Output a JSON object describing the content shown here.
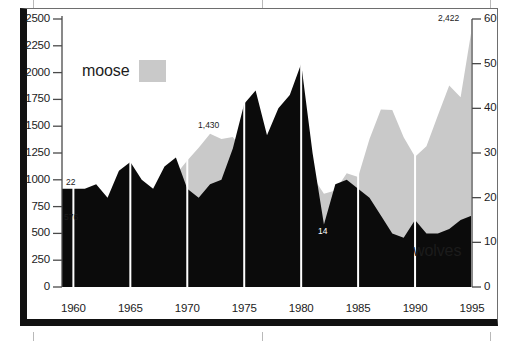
{
  "chart_data": {
    "type": "area",
    "title": "",
    "xlabel": "",
    "ylabel": "",
    "grid": true,
    "legend_position": "inside",
    "x": [
      1959,
      1960,
      1961,
      1962,
      1963,
      1964,
      1965,
      1966,
      1967,
      1968,
      1969,
      1970,
      1971,
      1972,
      1973,
      1974,
      1975,
      1976,
      1977,
      1978,
      1979,
      1980,
      1981,
      1982,
      1983,
      1984,
      1985,
      1986,
      1987,
      1988,
      1989,
      1990,
      1991,
      1992,
      1993,
      1994,
      1995
    ],
    "xtick_labels": [
      "1960",
      "1965",
      "1970",
      "1975",
      "1980",
      "1985",
      "1990",
      "1995"
    ],
    "xticks": [
      1960,
      1965,
      1970,
      1975,
      1980,
      1985,
      1990,
      1995
    ],
    "xlim": [
      1959,
      1995
    ],
    "series": [
      {
        "name": "moose",
        "axis": "left",
        "color": "#c9c9c9",
        "ylabel": "moose",
        "ylim": [
          0,
          2500
        ],
        "ytick_labels": [
          "0",
          "250",
          "500",
          "750",
          "1000",
          "1250",
          "1500",
          "1750",
          "2000",
          "2250",
          "2500"
        ],
        "yticks": [
          0,
          250,
          500,
          750,
          1000,
          1250,
          1500,
          1750,
          2000,
          2250,
          2500
        ],
        "values": [
          576,
          600,
          617,
          640,
          670,
          700,
          740,
          780,
          860,
          960,
          1050,
          1180,
          1300,
          1430,
          1380,
          1400,
          1260,
          1180,
          1070,
          1080,
          960,
          1000,
          1030,
          870,
          900,
          1060,
          1025,
          1380,
          1655,
          1650,
          1397,
          1216,
          1313,
          1600,
          1880,
          1770,
          2422
        ]
      },
      {
        "name": "wolves",
        "axis": "right",
        "color": "#0b0b0b",
        "ylabel": "wolves",
        "ylim": [
          0,
          60
        ],
        "ytick_labels": [
          "0",
          "10",
          "20",
          "30",
          "40",
          "50",
          "60"
        ],
        "yticks": [
          0,
          10,
          20,
          30,
          40,
          50,
          60
        ],
        "values": [
          22,
          22,
          22,
          23,
          20,
          26,
          28,
          24,
          22,
          27,
          29,
          22,
          20,
          23,
          24,
          31,
          41,
          44,
          34,
          40,
          43,
          50,
          30,
          14,
          23,
          24,
          22,
          20,
          16,
          12,
          11,
          15,
          12,
          12,
          13,
          15,
          16
        ]
      }
    ],
    "annotations": [
      {
        "label": "576",
        "x": 1959,
        "y": 576,
        "series": "moose",
        "style": "dark"
      },
      {
        "label": "22",
        "x": 1959,
        "y": 22,
        "series": "wolves",
        "style": "dark"
      },
      {
        "label": "1,430",
        "x": 1972,
        "y": 1430,
        "series": "moose",
        "style": "dark"
      },
      {
        "label": "50",
        "x": 1980,
        "y": 50,
        "series": "wolves",
        "style": "white"
      },
      {
        "label": "14",
        "x": 1982,
        "y": 14,
        "series": "wolves",
        "style": "white"
      },
      {
        "label": "2,422",
        "x": 1995,
        "y": 2422,
        "series": "moose",
        "style": "dark"
      }
    ]
  },
  "legends": {
    "moose": {
      "label": "moose",
      "swatch_color": "#c9c9c9"
    },
    "wolves": {
      "label": "wolves",
      "swatch_color": "#0b0b0b"
    }
  },
  "axes": {
    "left_ticks": [
      "2500",
      "2250",
      "2000",
      "1750",
      "1500",
      "1250",
      "1000",
      "750",
      "500",
      "250",
      "0"
    ],
    "right_ticks": [
      "60",
      "50",
      "40",
      "30",
      "20",
      "10",
      "0"
    ],
    "bottom_ticks": [
      "1960",
      "1965",
      "1970",
      "1975",
      "1980",
      "1985",
      "1990",
      "1995"
    ]
  },
  "colors": {
    "moose_fill": "#c9c9c9",
    "wolves_fill": "#0b0b0b",
    "gridline": "#ffffff",
    "axis_line": "#4a4a4a",
    "text": "#1c1c1c",
    "frame": "#111111",
    "background": "#ffffff"
  }
}
